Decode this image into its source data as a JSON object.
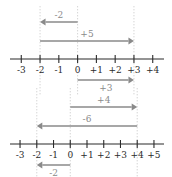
{
  "chart_data": [
    {
      "type": "line",
      "name": "number-line-top",
      "title": "",
      "xlabel": "",
      "ylabel": "",
      "grid": true,
      "legend": "none",
      "axis_min": -3.6,
      "axis_max": 4.6,
      "xlim": [
        -3.6,
        4.6
      ],
      "ticks": [
        -3,
        -2,
        -1,
        0,
        1,
        2,
        3,
        4
      ],
      "tick_labels": [
        "-3",
        "-2",
        "-1",
        "0",
        "+1",
        "+2",
        "+3",
        "+4"
      ],
      "guides": [
        -2,
        0,
        3
      ],
      "vectors": [
        {
          "label": "-2",
          "from": 0,
          "to": -2,
          "direction": "left",
          "row": 0,
          "label_side": "above"
        },
        {
          "label": "+5",
          "from": -2,
          "to": 3,
          "direction": "right",
          "row": 1,
          "label_side": "above"
        },
        {
          "label": "+3",
          "from": 0,
          "to": 3,
          "direction": "right",
          "row": 2,
          "label_side": "below"
        }
      ]
    },
    {
      "type": "line",
      "name": "number-line-bottom",
      "title": "",
      "xlabel": "",
      "ylabel": "",
      "grid": true,
      "legend": "none",
      "axis_min": -3.6,
      "axis_max": 5.6,
      "xlim": [
        -3.6,
        5.6
      ],
      "ticks": [
        -3,
        -2,
        -1,
        0,
        1,
        2,
        3,
        4,
        5
      ],
      "tick_labels": [
        "-3",
        "-2",
        "-1",
        "0",
        "+1",
        "+2",
        "+3",
        "+4",
        "+5"
      ],
      "guides": [
        -2,
        0,
        4
      ],
      "vectors": [
        {
          "label": "+4",
          "from": 0,
          "to": 4,
          "direction": "right",
          "row": 0,
          "label_side": "above"
        },
        {
          "label": "-6",
          "from": 4,
          "to": -2,
          "direction": "left",
          "row": 1,
          "label_side": "above"
        },
        {
          "label": "-2",
          "from": 0,
          "to": -2,
          "direction": "left",
          "row": 2,
          "label_side": "below"
        }
      ]
    }
  ],
  "colors": {
    "axis": "#2b2b2b",
    "vector": "#8a8a8a",
    "guide": "#c9c9c9",
    "background": "#ffffff"
  }
}
